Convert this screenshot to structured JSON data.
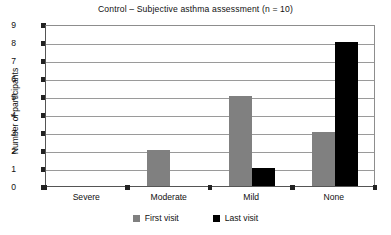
{
  "chart_data": {
    "type": "bar",
    "title": "Control – Subjective asthma assessment (n = 10)",
    "xlabel": "",
    "ylabel": "Number of participants",
    "categories": [
      "Severe",
      "Moderate",
      "Mild",
      "None"
    ],
    "series": [
      {
        "name": "First visit",
        "color": "#808080",
        "values": [
          0,
          2,
          5,
          3
        ]
      },
      {
        "name": "Last visit",
        "color": "#000000",
        "values": [
          0,
          0,
          1,
          8
        ]
      }
    ],
    "ylim": [
      0,
      9
    ],
    "yticks": [
      0,
      1,
      2,
      3,
      4,
      5,
      6,
      7,
      8,
      9
    ],
    "ytick_labels": [
      "0",
      "1",
      "2",
      "3",
      "4",
      "5",
      "6",
      "7",
      "8",
      "9"
    ],
    "grid": true,
    "grid_axis": "y",
    "legend_position": "bottom-center",
    "legend_entries": [
      "First visit",
      "Last visit"
    ]
  }
}
